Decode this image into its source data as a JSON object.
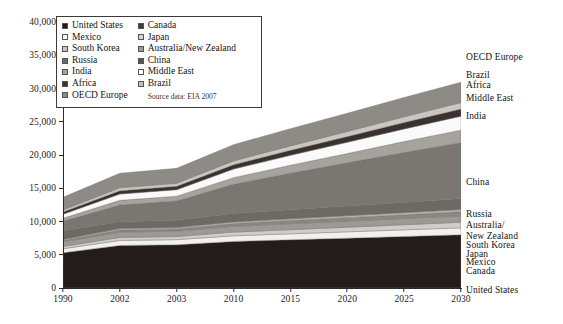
{
  "chart_data": {
    "type": "area",
    "title": "",
    "subtitle": "",
    "xlabel": "",
    "ylabel": "",
    "source_note": "Source data: EIA 2007",
    "grid": false,
    "legend_position": "top-left",
    "categories": [
      "1990",
      "2002",
      "2003",
      "2010",
      "2015",
      "2020",
      "2025",
      "2030"
    ],
    "x": [
      "1990",
      "2002",
      "2003",
      "2010",
      "2015",
      "2020",
      "2025",
      "2030"
    ],
    "ylim": [
      0,
      40000
    ],
    "yticks": [
      0,
      5000,
      10000,
      15000,
      20000,
      25000,
      30000,
      35000,
      40000
    ],
    "ytick_labels": [
      "0",
      "5,000",
      "10,000",
      "15,000",
      "20,000",
      "25,000",
      "30,000",
      "35,000",
      "40,000"
    ],
    "stacked": true,
    "series": [
      {
        "name": "United States",
        "color": "#241c1a",
        "values": [
          5300,
          6400,
          6500,
          7000,
          7250,
          7500,
          7750,
          8000
        ]
      },
      {
        "name": "Canada",
        "color": "#f2f0ee",
        "values": [
          600,
          750,
          770,
          850,
          900,
          950,
          1000,
          1050
        ]
      },
      {
        "name": "Mexico",
        "color": "#cfcdc9",
        "values": [
          350,
          450,
          470,
          560,
          620,
          690,
          760,
          840
        ]
      },
      {
        "name": "Japan",
        "color": "#9d9a96",
        "values": [
          700,
          800,
          810,
          870,
          900,
          920,
          940,
          960
        ]
      },
      {
        "name": "South Korea",
        "color": "#8b8884",
        "values": [
          190,
          330,
          340,
          420,
          470,
          520,
          560,
          600
        ]
      },
      {
        "name": "Australia/New Zealand",
        "color": "#b9b6b2",
        "values": [
          150,
          200,
          205,
          240,
          265,
          290,
          315,
          340
        ]
      },
      {
        "name": "Russia",
        "color": "#6d6a66",
        "values": [
          1300,
          1050,
          1080,
          1250,
          1350,
          1450,
          1550,
          1650
        ]
      },
      {
        "name": "China",
        "color": "#7a7773",
        "values": [
          1450,
          2500,
          2900,
          4400,
          5500,
          6500,
          7500,
          8400
        ]
      },
      {
        "name": "India",
        "color": "#a6a39f",
        "values": [
          450,
          700,
          730,
          1000,
          1200,
          1400,
          1650,
          1900
        ]
      },
      {
        "name": "Middle East",
        "color": "#fafafa",
        "values": [
          600,
          950,
          980,
          1300,
          1500,
          1700,
          1900,
          2100
        ]
      },
      {
        "name": "Africa",
        "color": "#3a322f",
        "values": [
          350,
          500,
          520,
          650,
          750,
          850,
          960,
          1080
        ]
      },
      {
        "name": "Brazil",
        "color": "#cac7c3",
        "values": [
          300,
          430,
          440,
          570,
          660,
          760,
          860,
          970
        ]
      },
      {
        "name": "OECD Europe",
        "color": "#8e8b87",
        "values": [
          1900,
          2200,
          2250,
          2450,
          2600,
          2750,
          2900,
          3050
        ]
      }
    ],
    "totals": [
      13640,
      17260,
      17995,
      21560,
      23965,
      26280,
      28645,
      30940
    ],
    "annotations_right": [
      {
        "label": "OECD Europe",
        "value": 30940
      },
      {
        "label": "Brazil",
        "value": 27890
      },
      {
        "label": "Africa",
        "value": 26920
      },
      {
        "label": "Middle East",
        "value": 25840
      },
      {
        "label": "India",
        "value": 23740
      },
      {
        "label": "China",
        "value": 21840
      },
      {
        "label": "Russia",
        "value": 13440
      },
      {
        "label": "Australia/",
        "value": 11790
      },
      {
        "label": "New Zealand",
        "value": 11450
      },
      {
        "label": "South Korea",
        "value": 11110
      },
      {
        "label": "Japan",
        "value": 10510
      },
      {
        "label": "Mexico",
        "value": 9550
      },
      {
        "label": "Canada",
        "value": 8710
      },
      {
        "label": "United States",
        "value": 8000
      }
    ]
  },
  "legend": {
    "column_left": [
      {
        "label": "United States",
        "swatch": "#241c1a"
      },
      {
        "label": "Mexico",
        "swatch": "#ffffff"
      },
      {
        "label": "South Korea",
        "swatch": "#c8c5c1"
      },
      {
        "label": "Russia",
        "swatch": "#6d6a66"
      },
      {
        "label": "India",
        "swatch": "#a6a39f"
      },
      {
        "label": "Africa",
        "swatch": "#3a322f"
      },
      {
        "label": "OECD Europe",
        "swatch": "#8e8b87"
      }
    ],
    "column_right": [
      {
        "label": "Canada",
        "swatch": "#3f3b38"
      },
      {
        "label": "Japan",
        "swatch": "#d8d5d1"
      },
      {
        "label": "Australia/New Zealand",
        "swatch": "#9d9a96"
      },
      {
        "label": "China",
        "swatch": "#57534f"
      },
      {
        "label": "Middle East",
        "swatch": "#ffffff"
      },
      {
        "label": "Brazil",
        "swatch": "#c2bfbb"
      }
    ],
    "source": "Source data: EIA 2007"
  },
  "axis": {
    "y_labels": [
      "40,000",
      "35,000",
      "30,000",
      "25,000",
      "20,000",
      "15,000",
      "10,000",
      "5,000",
      "0"
    ],
    "x_labels": [
      "1990",
      "2002",
      "2003",
      "2010",
      "2015",
      "2020",
      "2025",
      "2030"
    ]
  },
  "right_labels": [
    {
      "label": "OECD Europe",
      "y": 52
    },
    {
      "label": "Brazil",
      "y": 70
    },
    {
      "label": "Africa",
      "y": 80
    },
    {
      "label": "Middle East",
      "y": 93
    },
    {
      "label": "India",
      "y": 111
    },
    {
      "label": "China",
      "y": 177
    },
    {
      "label": "Russia",
      "y": 209
    },
    {
      "label": "Australia/",
      "y": 220
    },
    {
      "label": "New Zealand",
      "y": 231
    },
    {
      "label": "South Korea",
      "y": 240
    },
    {
      "label": "Japan",
      "y": 249
    },
    {
      "label": "Mexico",
      "y": 257
    },
    {
      "label": "Canada",
      "y": 266
    },
    {
      "label": "United States",
      "y": 285
    }
  ]
}
